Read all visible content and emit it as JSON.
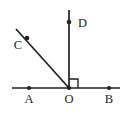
{
  "figure": {
    "canvas": {
      "width": 130,
      "height": 115,
      "background": "#ffffff"
    },
    "stroke_color": "#231f20",
    "points": {
      "A": {
        "label": "A",
        "dot_x": 29,
        "dot_y": 88,
        "label_x": 29,
        "label_y": 103
      },
      "O": {
        "label": "O",
        "dot_x": 69,
        "dot_y": 88,
        "label_x": 69,
        "label_y": 103
      },
      "B": {
        "label": "B",
        "dot_x": 109,
        "dot_y": 88,
        "label_x": 109,
        "label_y": 103
      },
      "C": {
        "label": "C",
        "dot_x": 27,
        "dot_y": 38,
        "label_x": 18,
        "label_y": 49
      },
      "D": {
        "label": "D",
        "dot_x": 69,
        "dot_y": 22,
        "label_x": 78,
        "label_y": 27
      }
    },
    "segments": {
      "horizontal_line": {
        "x1": 12,
        "y1": 88,
        "x2": 120,
        "y2": 88
      },
      "vertical_ray_OD": {
        "x1": 69,
        "y1": 88,
        "x2": 69,
        "y2": 10
      },
      "diagonal_ray_OC": {
        "x1": 69,
        "y1": 88,
        "x2": 16,
        "y2": 29
      }
    },
    "right_angle_marker": {
      "name": "right-angle-at-O",
      "path": "M 69 79 L 78 79 L 78 88",
      "measure": "90"
    },
    "dot_radius": 2.1
  }
}
